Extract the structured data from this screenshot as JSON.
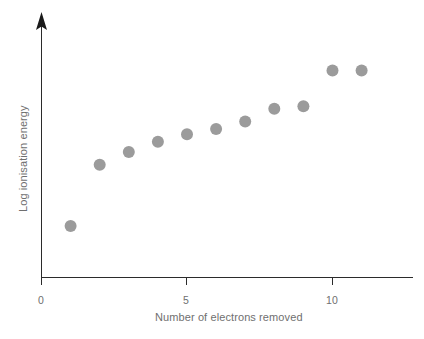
{
  "figure": {
    "background_color": "#ffffff",
    "width": 424,
    "height": 339
  },
  "axes": {
    "x_title": "Number of electrons removed",
    "y_title": "Log ionisation energy",
    "x_tick_labels": [
      "0",
      "5",
      "10"
    ],
    "axis_color": "#2b2b2b",
    "label_color": "#6f6f6f",
    "y_axis_has_arrow": true,
    "y_tick_labels": []
  },
  "marker_style": {
    "color": "#9b9b9b",
    "shape": "circle",
    "radius_px": 6
  },
  "chart_data": {
    "type": "scatter",
    "title": "",
    "xlabel": "Number of electrons removed",
    "ylabel": "Log ionisation energy",
    "xlim": [
      0,
      12.8
    ],
    "ylim": [
      0,
      1
    ],
    "xticks": [
      0,
      5,
      10
    ],
    "yticks": [],
    "grid": false,
    "legend": false,
    "series": [
      {
        "name": "Log ionisation energy",
        "color": "#9b9b9b",
        "x": [
          1,
          2,
          3,
          4,
          5,
          6,
          7,
          8,
          9,
          10,
          11
        ],
        "y": [
          0.2,
          0.44,
          0.49,
          0.53,
          0.56,
          0.58,
          0.61,
          0.66,
          0.67,
          0.81,
          0.81
        ]
      }
    ],
    "annotations": []
  }
}
